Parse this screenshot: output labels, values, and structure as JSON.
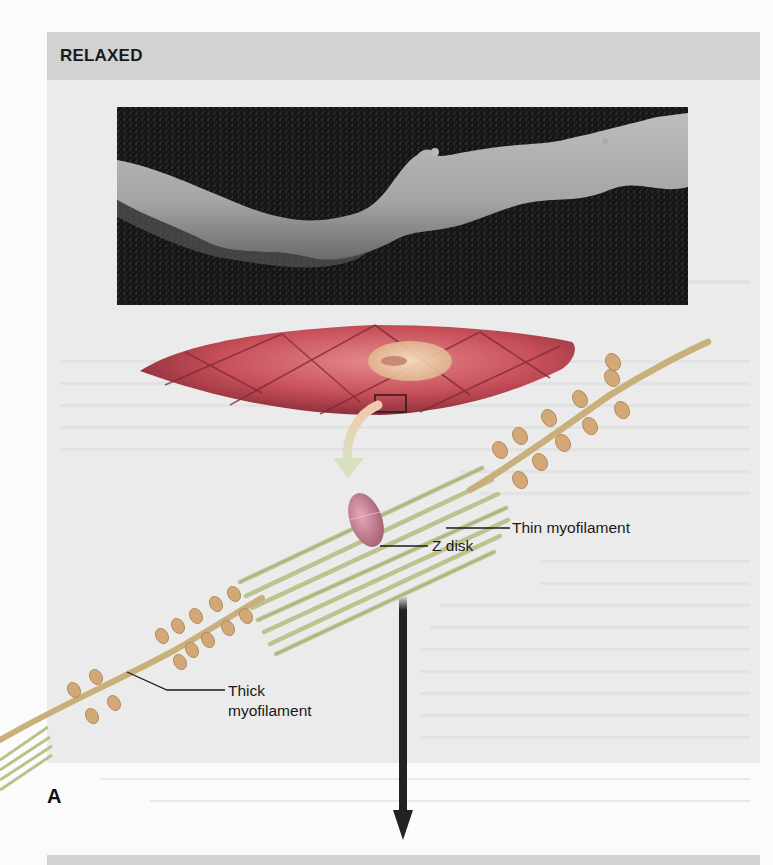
{
  "figure": {
    "panel_title": "RELAXED",
    "panel_letter": "A",
    "labels": {
      "thin_myofilament": "Thin myofilament",
      "z_disk": "Z disk",
      "thick_myofilament_line1": "Thick",
      "thick_myofilament_line2": "myofilament"
    },
    "elements": {
      "micrograph": "micrograph-of-relaxed-smooth-muscle-cell",
      "cell_drawing": "spindle-shaped-smooth-muscle-cell",
      "zoom_box": "enlarged-region-marker",
      "curved_arrow": "curved-arrow-icon",
      "down_arrow": "down-arrow-icon"
    },
    "colors": {
      "header_bg": "#d2d2d2",
      "panel_bg": "#ebebeb",
      "photo_bg": "#141414",
      "cell_fill": "#c8505a",
      "cell_grid": "#7a2a34",
      "nucleus": "#e8c9a0",
      "thin_filament": "#b9c28a",
      "thick_filament": "#c9b07a",
      "myosin_heads": "#d4a876",
      "z_disk": "#c07a8c",
      "arrow": "#222222"
    }
  }
}
